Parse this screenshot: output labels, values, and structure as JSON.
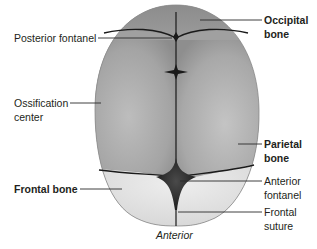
{
  "diagram": {
    "caption": "Anterior",
    "colors": {
      "parietal": "#9e9e9e",
      "occipital": "#8a8a8a",
      "frontal": "#dcdcdc",
      "suture": "#1a1a1a",
      "leader": "#2b2b2b",
      "text": "#231f20"
    },
    "labels_left": [
      {
        "id": "posterior-fontanel",
        "lines": [
          "Posterior fontanel"
        ],
        "bold": false
      },
      {
        "id": "ossification-center",
        "lines": [
          "Ossification",
          "center"
        ],
        "bold": false
      },
      {
        "id": "frontal-bone",
        "lines": [
          "Frontal bone"
        ],
        "bold": true
      }
    ],
    "labels_right": [
      {
        "id": "occipital-bone",
        "lines": [
          "Occipital",
          "bone"
        ],
        "bold": true
      },
      {
        "id": "parietal-bone",
        "lines": [
          "Parietal",
          "bone"
        ],
        "bold": true
      },
      {
        "id": "anterior-fontanel",
        "lines": [
          "Anterior",
          "fontanel"
        ],
        "bold": false
      },
      {
        "id": "frontal-suture",
        "lines": [
          "Frontal",
          "suture"
        ],
        "bold": false
      }
    ]
  }
}
